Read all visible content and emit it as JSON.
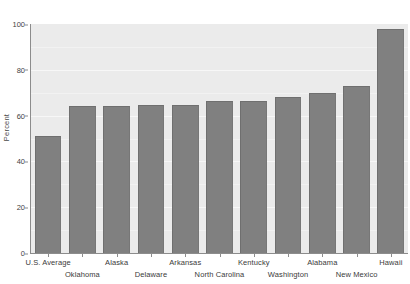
{
  "chart_data": {
    "type": "bar",
    "title": "",
    "subtitle": "",
    "xlabel": "",
    "ylabel": "Percent",
    "ylim": [
      0,
      100
    ],
    "yticks": [
      0,
      20,
      40,
      60,
      80,
      100
    ],
    "grid": true,
    "legend": false,
    "legend_position": "none",
    "orientation": "vertical",
    "bar_color": "#808080",
    "bar_edge_color": "#6f6f6f",
    "plot_background": "#ebebeb",
    "gridline_color": "#f7f7f7",
    "figure_background": "#ffffff",
    "axis_color": "#8c8c8c",
    "label_stagger": true,
    "categories": [
      "U.S. Average",
      "Oklahoma",
      "Alaska",
      "Delaware",
      "Arkansas",
      "North Carolina",
      "Kentucky",
      "Washington",
      "Alabama",
      "New Mexico",
      "Hawaii"
    ],
    "values": [
      51,
      64,
      64,
      64.5,
      64.5,
      66.5,
      66.5,
      68,
      70,
      73,
      98
    ],
    "label_rows": [
      0,
      1,
      0,
      1,
      0,
      1,
      0,
      1,
      0,
      1,
      0
    ]
  }
}
